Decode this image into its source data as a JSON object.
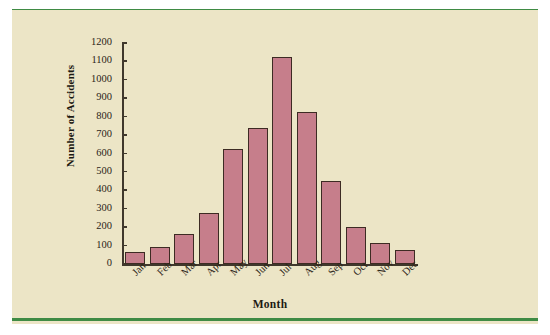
{
  "figure": {
    "background_color": "#ece5c6",
    "rule_color": "#3f8b44",
    "bar_fill_color": "#c67e8b",
    "bar_border_color": "#3d2b23",
    "axis_color": "#40382c"
  },
  "chart_data": {
    "type": "bar",
    "title": "",
    "xlabel": "Month",
    "ylabel": "Number of Accidents",
    "categories": [
      "Jan",
      "Feb",
      "Mar",
      "Apr",
      "May",
      "Jun",
      "Jul",
      "Aug",
      "Sep",
      "Oct",
      "Nov",
      "Dec"
    ],
    "values": [
      65,
      90,
      165,
      275,
      625,
      740,
      1125,
      825,
      450,
      200,
      115,
      75
    ],
    "ylim": [
      0,
      1200
    ],
    "ytick_labels": [
      "0",
      "100",
      "200",
      "300",
      "400",
      "500",
      "600",
      "700",
      "800",
      "900",
      "1000",
      "1100",
      "1200"
    ],
    "ytick_values": [
      0,
      100,
      200,
      300,
      400,
      500,
      600,
      700,
      800,
      900,
      1000,
      1100,
      1200
    ],
    "grid": false,
    "legend": null,
    "legend_position": "none"
  }
}
